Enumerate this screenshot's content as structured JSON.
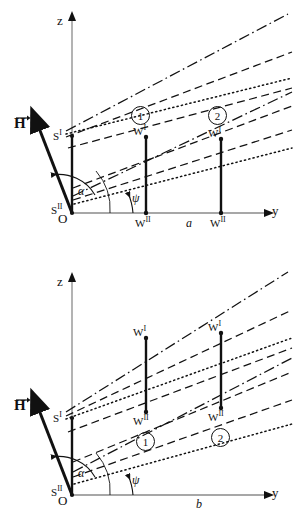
{
  "figure": {
    "type": "scientific-line-diagram",
    "panels": [
      {
        "id": "a",
        "label": "a",
        "axes": {
          "vertical": "z",
          "horizontal": "y"
        },
        "origin_labels": {
          "upper": "S",
          "upper_sup": "II",
          "lower": "O"
        },
        "s_prime_label": "S",
        "s_prime_sup": "I",
        "vector_label": "H",
        "angles": [
          {
            "name": "alpha",
            "glyph": "α"
          },
          {
            "name": "psi",
            "glyph": "ψ"
          }
        ],
        "stations": [
          {
            "circle": "1",
            "top_label": "W",
            "top_sup": "I",
            "bottom_label": "W",
            "bottom_sup": "II"
          },
          {
            "circle": "2",
            "top_label": "W",
            "top_sup": "I",
            "bottom_label": "W",
            "bottom_sup": "II"
          }
        ],
        "note": "vertical segments run from W' down to W'' on the y-axis; circled numbers sit above W'"
      },
      {
        "id": "b",
        "label": "b",
        "axes": {
          "vertical": "z",
          "horizontal": "y"
        },
        "origin_labels": {
          "upper": "S",
          "upper_sup": "II",
          "lower": "O"
        },
        "s_prime_label": "S",
        "s_prime_sup": "I",
        "vector_label": "H",
        "angles": [
          {
            "name": "alpha",
            "glyph": "α"
          },
          {
            "name": "psi",
            "glyph": "ψ"
          }
        ],
        "stations": [
          {
            "circle": "1",
            "top_label": "W",
            "top_sup": "I",
            "bottom_label": "W",
            "bottom_sup": "II"
          },
          {
            "circle": "2",
            "top_label": "W",
            "top_sup": "I",
            "bottom_label": "W",
            "bottom_sup": "II"
          }
        ],
        "note": "vertical segments float above the y-axis; circled numbers sit below W''"
      }
    ],
    "line_styles": [
      "dash-dot",
      "dashed",
      "dotted",
      "solid"
    ],
    "colors": {
      "ink": "#111111",
      "axis": "#8a8a8a",
      "background": "#ffffff"
    }
  }
}
